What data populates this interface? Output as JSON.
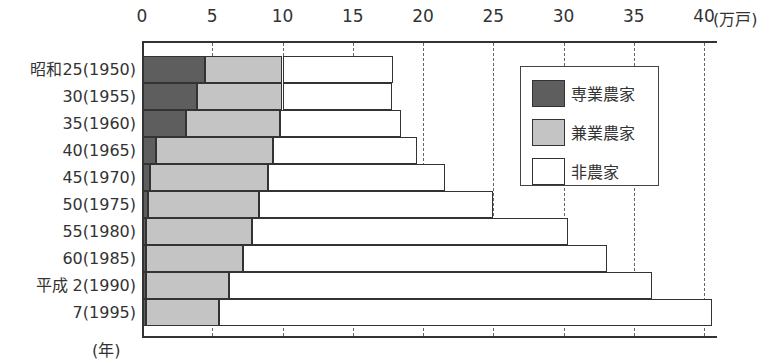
{
  "chart_data": {
    "type": "bar",
    "orientation": "horizontal",
    "stacked": true,
    "title": "",
    "xlabel": "(万戸)",
    "ylabel": "(年)",
    "xlim": [
      0,
      40
    ],
    "x_ticks": [
      0,
      5,
      10,
      15,
      20,
      25,
      30,
      35,
      40
    ],
    "grid": "vertical dashed at 20, 25, 30, 35, 40",
    "legend_position": "upper right inside",
    "categories": [
      "昭和25(1950)",
      "30(1955)",
      "35(1960)",
      "40(1965)",
      "45(1970)",
      "50(1975)",
      "55(1980)",
      "60(1985)",
      "平成 2(1990)",
      "7(1995)"
    ],
    "series": [
      {
        "name": "専業農家",
        "color": "#5e5e5e",
        "values": [
          4.5,
          3.9,
          3.1,
          1.0,
          0.6,
          0.4,
          0.3,
          0.3,
          0.3,
          0.3
        ]
      },
      {
        "name": "兼業農家",
        "color": "#c4c4c4",
        "values": [
          5.5,
          6.1,
          6.7,
          8.3,
          8.4,
          7.9,
          7.5,
          6.9,
          5.9,
          5.2
        ]
      },
      {
        "name": "非農家",
        "color": "#ffffff",
        "values": [
          7.9,
          7.8,
          8.6,
          10.3,
          12.6,
          16.7,
          22.5,
          25.9,
          30.1,
          35.1
        ]
      }
    ],
    "totals": [
      17.9,
      17.8,
      18.4,
      19.6,
      21.6,
      25.0,
      30.3,
      33.1,
      36.3,
      40.6
    ]
  },
  "axis": {
    "unit_label": "(万戸)",
    "year_unit_label": "(年)",
    "ticks": [
      "0",
      "5",
      "10",
      "15",
      "20",
      "25",
      "30",
      "35",
      "40"
    ]
  },
  "legend": {
    "items": [
      {
        "label": "専業農家",
        "color": "#5e5e5e"
      },
      {
        "label": "兼業農家",
        "color": "#c4c4c4"
      },
      {
        "label": "非農家",
        "color": "#ffffff"
      }
    ]
  },
  "rows": [
    {
      "label": "昭和25(1950)"
    },
    {
      "label": "30(1955)"
    },
    {
      "label": "35(1960)"
    },
    {
      "label": "40(1965)"
    },
    {
      "label": "45(1970)"
    },
    {
      "label": "50(1975)"
    },
    {
      "label": "55(1980)"
    },
    {
      "label": "60(1985)"
    },
    {
      "label": "平成 2(1990)"
    },
    {
      "label": "7(1995)"
    }
  ]
}
